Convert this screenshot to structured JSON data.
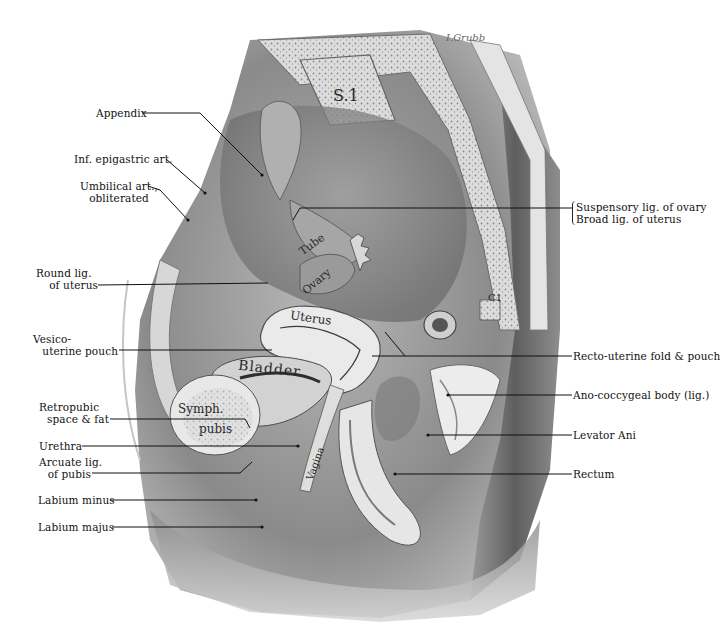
{
  "figure": {
    "signature": "I.Grubb",
    "left_labels": [
      {
        "text": "Appendix"
      },
      {
        "text": "Inf. epigastric art."
      },
      {
        "line1": "Umbilical art.,",
        "line2": "obliterated"
      },
      {
        "line1": "Round lig.",
        "line2": "of uterus"
      },
      {
        "line1": "Vesico-",
        "line2": "uterine pouch"
      },
      {
        "line1": "Retropubic",
        "line2": "space & fat"
      },
      {
        "text": "Urethra"
      },
      {
        "line1": "Arcuate lig.",
        "line2": "of pubis"
      },
      {
        "text": "Labium minus"
      },
      {
        "text": "Labium majus"
      }
    ],
    "right_labels": [
      {
        "line1": "Suspensory lig. of ovary",
        "line2": "Broad lig. of uterus"
      },
      {
        "text": "Recto-uterine fold & pouch"
      },
      {
        "text": "Ano-coccygeal body (lig.)"
      },
      {
        "text": "Levator Ani"
      },
      {
        "text": "Rectum"
      }
    ],
    "inline_labels": {
      "s1": "S.1",
      "tube": "Tube",
      "ovary": "Ovary",
      "uterus": "Uterus",
      "bladder": "Bladder",
      "symph": "Symph.",
      "pubis": "pubis",
      "vagina": "Vagina",
      "c1": "C1"
    }
  }
}
